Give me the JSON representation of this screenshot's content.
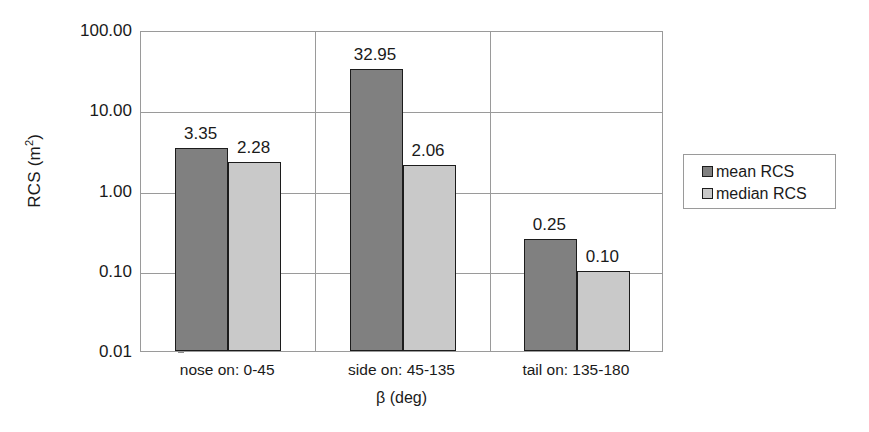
{
  "chart_data": {
    "type": "bar",
    "title": "",
    "xlabel": "β (deg)",
    "ylabel": "RCS (m2)",
    "ylabel_base": "RCS (m",
    "ylabel_exp": "2",
    "ylabel_tail": ")",
    "yscale": "log",
    "ylim": [
      0.01,
      100.0
    ],
    "grid": "both",
    "legend_position": "right",
    "categories": [
      "nose on:  0-45",
      "side on: 45-135",
      "tail on: 135-180"
    ],
    "y_tick_labels": [
      "100.00",
      "10.00",
      "1.00",
      "0.10",
      "0.01"
    ],
    "y_tick_values": [
      100.0,
      10.0,
      1.0,
      0.1,
      0.01
    ],
    "series": [
      {
        "name": "mean RCS",
        "color": "#808080",
        "values": [
          3.35,
          32.95,
          0.25
        ],
        "labels": [
          "3.35",
          "32.95",
          "0.25"
        ]
      },
      {
        "name": "median RCS",
        "color": "#c9c9c9",
        "values": [
          2.28,
          2.06,
          0.1
        ],
        "labels": [
          "2.28",
          "2.06",
          "0.10"
        ]
      }
    ]
  },
  "legend": {
    "items": [
      {
        "label": "mean RCS",
        "swatch": "mean"
      },
      {
        "label": "median RCS",
        "swatch": "median"
      }
    ]
  }
}
